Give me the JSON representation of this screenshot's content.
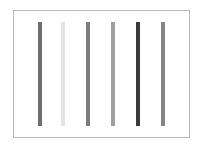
{
  "figure": {
    "background_color": "#ffffff",
    "width": 202,
    "height": 150
  },
  "axes": {
    "frame_color": "#b9b9bb",
    "facecolor": "#ffffff",
    "grid": false,
    "tick_labels_visible": false,
    "spines_visible": true
  },
  "chart_data": {
    "type": "bar",
    "title": "",
    "subtitle": "",
    "xlabel": "",
    "ylabel": "",
    "categories": [
      "1",
      "2",
      "3",
      "4",
      "5",
      "6"
    ],
    "values": [
      1,
      1,
      1,
      1,
      1,
      1
    ],
    "x": [
      1,
      2,
      3,
      4,
      5,
      6
    ],
    "xlim": [
      0.5,
      6.5
    ],
    "ylim": [
      0,
      1.1
    ],
    "bar_width": 0.04,
    "grid": false,
    "legend": null,
    "legend_position": "none",
    "tick_labels": {
      "x": [],
      "y": []
    },
    "annotations": [],
    "bar_colors": [
      "#6e6e70",
      "#e3e3e3",
      "#7d7d7f",
      "#a0a0a2",
      "#3a3a3c",
      "#848486"
    ],
    "series": [
      {
        "name": "bars",
        "values": [
          1,
          1,
          1,
          1,
          1,
          1
        ],
        "colors": [
          "#6e6e70",
          "#e3e3e3",
          "#7d7d7f",
          "#a0a0a2",
          "#3a3a3c",
          "#848486"
        ]
      }
    ],
    "bars": [
      {
        "index": 0,
        "label": "1",
        "value": 1,
        "color": "#6e6e70",
        "x_pct": 14.7
      },
      {
        "index": 1,
        "label": "2",
        "value": 1,
        "color": "#e3e3e3",
        "x_pct": 28.2
      },
      {
        "index": 2,
        "label": "3",
        "value": 1,
        "color": "#7d7d7f",
        "x_pct": 42.4
      },
      {
        "index": 3,
        "label": "4",
        "value": 1,
        "color": "#a0a0a2",
        "x_pct": 56.5
      },
      {
        "index": 4,
        "label": "5",
        "value": 1,
        "color": "#3a3a3c",
        "x_pct": 70.6
      },
      {
        "index": 5,
        "label": "6",
        "value": 1,
        "color": "#848486",
        "x_pct": 85.3
      }
    ]
  }
}
